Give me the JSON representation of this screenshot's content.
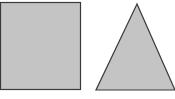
{
  "diagram": {
    "shapes": [
      {
        "type": "square",
        "fill": "#c4c4c4",
        "stroke": "#3a3a3a",
        "x": 0,
        "y": 2,
        "width": 80,
        "height": 88
      },
      {
        "type": "triangle",
        "fill": "#c4c4c4",
        "stroke": "#3a3a3a",
        "points": "137,4 96,90 175,90"
      }
    ]
  }
}
